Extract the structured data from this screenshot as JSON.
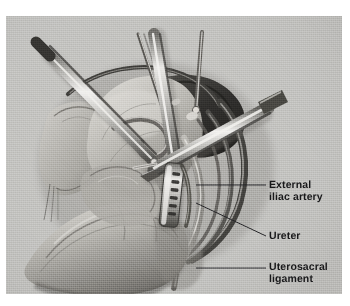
{
  "figure": {
    "kind": "medical-illustration",
    "medium": "graphite-and-wash drawing on toned paper",
    "palette": {
      "paper": "#bfbfbc",
      "paper_light": "#cfcfcb",
      "tissue_light": "#c9c7c2",
      "tissue_mid": "#9d9b96",
      "tissue_shadow": "#6e6c68",
      "deep_shadow": "#353431",
      "instrument_steel": "#b8b8b5",
      "instrument_highlight": "#ececea",
      "instrument_dark": "#4b4a47",
      "leader_line": "#232326",
      "label_text": "#18181a",
      "outer_background": "#ffffff"
    },
    "canvas": {
      "left": 6,
      "top": 16,
      "width": 336,
      "height": 278
    }
  },
  "labels": [
    {
      "id": "external-iliac-artery",
      "text": "External\niliac artery",
      "text_x": 269,
      "text_y": 180,
      "leader": {
        "from_x": 266,
        "from_y": 185,
        "to_x": 196,
        "to_y": 185
      }
    },
    {
      "id": "ureter",
      "text": "Ureter",
      "text_x": 269,
      "text_y": 231,
      "leader": {
        "from_x": 266,
        "from_y": 236,
        "to_x": 196,
        "to_y": 203
      }
    },
    {
      "id": "uterosacral-ligament",
      "text": "Uterosacral\nligament",
      "text_x": 269,
      "text_y": 262,
      "leader": {
        "from_x": 266,
        "from_y": 268,
        "to_x": 196,
        "to_y": 268
      }
    }
  ],
  "instruments": [
    {
      "id": "grasper-upper-left",
      "description": "long grasper entering from upper left, dark shaft with bright highlight"
    },
    {
      "id": "probe-thin-vertical",
      "description": "thin needle-like probe entering from top"
    },
    {
      "id": "retractor-vertical",
      "description": "broad steel retractor shaft entering from top center"
    },
    {
      "id": "dissector-upper-right",
      "description": "thin dissector entering from upper right"
    },
    {
      "id": "stapler-diagonal",
      "description": "linear stapler crossing from right toward centre"
    },
    {
      "id": "stapler-jaw",
      "description": "stapler cartridge jaw with visible staple row, applied to vascular pedicle"
    }
  ],
  "anatomy": [
    {
      "id": "uterus-body",
      "description": "rounded uterine fundus, left of centre"
    },
    {
      "id": "broad-ligament-fold",
      "description": "translucent peritoneal fold sweeping to the left"
    },
    {
      "id": "sigmoid-colon",
      "description": "bowel loop along the lower left"
    },
    {
      "id": "external-iliac-artery",
      "description": "long vessel running diagonally down the right side"
    },
    {
      "id": "ureter",
      "description": "pale tubular structure medial to the iliac vessels"
    },
    {
      "id": "uterosacral-ligament",
      "description": "fibrous band at the lower centre"
    },
    {
      "id": "pelvic-sidewall-recess",
      "description": "dark dissected space behind the uterus"
    }
  ]
}
